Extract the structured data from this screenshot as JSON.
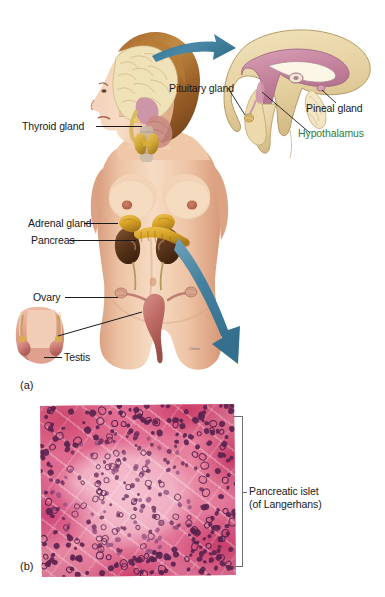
{
  "figure": {
    "panel_a_tag": "(a)",
    "panel_b_tag": "(b)",
    "photo_credit": "Chelex"
  },
  "labels": {
    "thyroid": "Thyroid gland",
    "pituitary": "Pituitary gland",
    "pineal": "Pineal gland",
    "hypothalamus": "Hypothalamus",
    "adrenal": "Adrenal gland",
    "pancreas": "Pancreas",
    "ovary": "Ovary",
    "testis": "Testis",
    "islet_line1": "Pancreatic islet",
    "islet_line2": "(of Langerhans)"
  },
  "colors": {
    "arrow": "#3f7f9e",
    "label_text": "#19181c",
    "hypothalamus_text": "#2e7d32",
    "bracket": "#6e6e74",
    "skin": "#e9bb9b",
    "brain_tan": "#e8d6a8",
    "brain_pink": "#c98aa4",
    "adrenal_gold": "#d8a72b",
    "kidney_brown": "#6a4327",
    "uterus_rose": "#c0706a",
    "micrograph_pink": "#e07a9b",
    "nucleus_purple": "#5c2350"
  },
  "chart_data": {
    "type": "diagram",
    "panels": [
      {
        "tag": "(a)",
        "description": "Anterior view of female body showing endocrine gland locations, with a midsagittal brain inset",
        "callouts": [
          "Thyroid gland",
          "Pituitary gland",
          "Pineal gland",
          "Hypothalamus",
          "Adrenal gland",
          "Pancreas",
          "Ovary",
          "Testis"
        ]
      },
      {
        "tag": "(b)",
        "description": "Light micrograph of pancreatic tissue",
        "callouts": [
          "Pancreatic islet (of Langerhans)"
        ]
      }
    ]
  }
}
